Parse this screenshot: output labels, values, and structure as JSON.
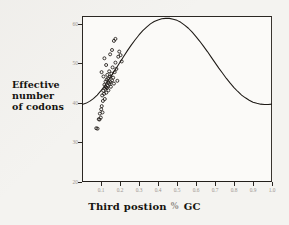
{
  "chart_data": {
    "type": "scatter",
    "title": "",
    "xlabel": "Third postion % GC",
    "ylabel": "Effective number of codons",
    "ylabel_lines": [
      "Effective",
      "number",
      "of codons"
    ],
    "xlim": [
      0.0,
      1.0
    ],
    "ylim": [
      20,
      62
    ],
    "grid": false,
    "legend": null,
    "xticks": [
      0.1,
      0.2,
      0.3,
      0.4,
      0.5,
      0.6,
      0.7,
      0.8,
      0.9,
      1.0
    ],
    "xticklabels": [
      "0.1",
      "0.2",
      "0.3",
      "0.4",
      "0.5",
      "0.6",
      "0.7",
      "0.8",
      "0.9",
      "1.0"
    ],
    "yticks": [
      20,
      30,
      40,
      50,
      60
    ],
    "yticklabels": [
      "20",
      "30",
      "40",
      "50",
      "60"
    ],
    "series": [
      {
        "name": "expected ENC curve",
        "type": "line",
        "color": "#1d1915",
        "x": [
          0.0,
          0.02,
          0.04,
          0.06,
          0.08,
          0.1,
          0.12,
          0.14,
          0.16,
          0.18,
          0.2,
          0.22,
          0.24,
          0.26,
          0.28,
          0.3,
          0.32,
          0.34,
          0.36,
          0.38,
          0.4,
          0.42,
          0.44,
          0.46,
          0.48,
          0.5,
          0.52,
          0.54,
          0.56,
          0.58,
          0.6,
          0.62,
          0.64,
          0.66,
          0.68,
          0.7,
          0.72,
          0.74,
          0.76,
          0.78,
          0.8,
          0.82,
          0.84,
          0.86,
          0.88,
          0.9,
          0.92,
          0.94,
          0.96,
          0.98,
          1.0
        ],
        "y": [
          39.6,
          39.9,
          40.4,
          41.1,
          42.0,
          43.1,
          44.4,
          45.8,
          47.3,
          48.8,
          50.3,
          51.8,
          53.3,
          54.7,
          56.0,
          57.2,
          58.3,
          59.2,
          60.0,
          60.6,
          61.0,
          61.3,
          61.4,
          61.4,
          61.2,
          60.9,
          60.4,
          59.7,
          58.9,
          57.9,
          56.8,
          55.6,
          54.3,
          53.0,
          51.6,
          50.2,
          48.8,
          47.5,
          46.2,
          45.0,
          43.9,
          42.9,
          42.0,
          41.3,
          40.7,
          40.2,
          39.9,
          39.7,
          39.6,
          39.6,
          39.7
        ]
      },
      {
        "name": "genes",
        "type": "scatter",
        "marker": "open-circle",
        "color": "#1d1915",
        "points": [
          [
            0.075,
            33.6
          ],
          [
            0.082,
            33.5
          ],
          [
            0.088,
            35.9
          ],
          [
            0.092,
            35.8
          ],
          [
            0.094,
            37.3
          ],
          [
            0.099,
            36.3
          ],
          [
            0.101,
            38.4
          ],
          [
            0.104,
            39.2
          ],
          [
            0.106,
            41.9
          ],
          [
            0.108,
            37.6
          ],
          [
            0.11,
            40.5
          ],
          [
            0.112,
            43.1
          ],
          [
            0.113,
            46.7
          ],
          [
            0.116,
            42.3
          ],
          [
            0.118,
            44.6
          ],
          [
            0.12,
            41.0
          ],
          [
            0.122,
            43.6
          ],
          [
            0.124,
            45.4
          ],
          [
            0.126,
            44.0
          ],
          [
            0.128,
            42.6
          ],
          [
            0.13,
            45.9
          ],
          [
            0.131,
            43.8
          ],
          [
            0.133,
            47.1
          ],
          [
            0.135,
            44.3
          ],
          [
            0.137,
            46.2
          ],
          [
            0.139,
            43.2
          ],
          [
            0.141,
            45.1
          ],
          [
            0.143,
            48.0
          ],
          [
            0.145,
            44.8
          ],
          [
            0.148,
            46.6
          ],
          [
            0.15,
            45.3
          ],
          [
            0.152,
            44.1
          ],
          [
            0.155,
            47.4
          ],
          [
            0.158,
            45.7
          ],
          [
            0.161,
            49.0
          ],
          [
            0.164,
            46.4
          ],
          [
            0.127,
            49.6
          ],
          [
            0.118,
            51.3
          ],
          [
            0.168,
            44.9
          ],
          [
            0.172,
            47.8
          ],
          [
            0.176,
            50.2
          ],
          [
            0.181,
            48.6
          ],
          [
            0.186,
            45.6
          ],
          [
            0.191,
            51.7
          ],
          [
            0.196,
            53.0
          ],
          [
            0.203,
            52.1
          ],
          [
            0.209,
            50.5
          ],
          [
            0.168,
            55.7
          ],
          [
            0.176,
            56.2
          ],
          [
            0.158,
            53.4
          ],
          [
            0.148,
            52.3
          ],
          [
            0.103,
            47.8
          ]
        ]
      }
    ]
  }
}
